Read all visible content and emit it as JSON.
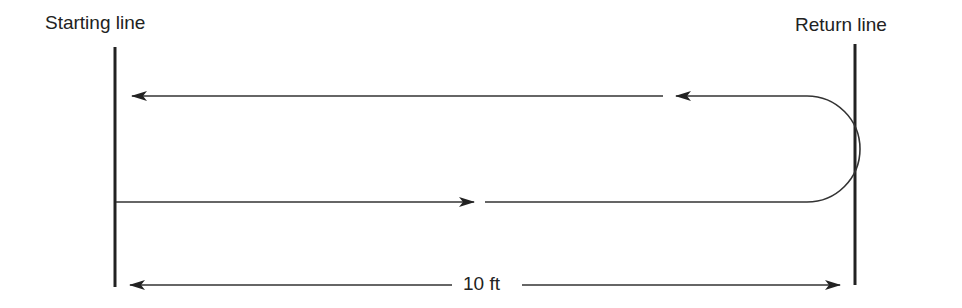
{
  "diagram": {
    "labels": {
      "start": "Starting line",
      "return": "Return line",
      "distance": "10 ft"
    },
    "elements": {
      "start_line_x": 115,
      "return_line_x": 855,
      "outbound_path_y": 202,
      "return_path_y": 96
    },
    "colors": {
      "stroke": "#222222",
      "background": "#ffffff"
    }
  }
}
